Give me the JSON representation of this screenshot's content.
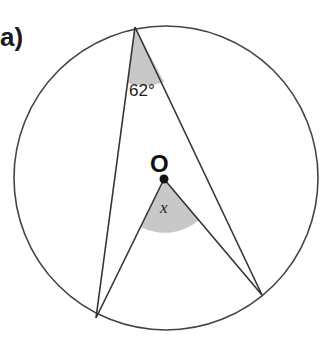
{
  "part_label": "a)",
  "angle_label": "62°",
  "center_label": "O",
  "unknown_label": "x",
  "colors": {
    "stroke": "#444444",
    "shade": "#c8c8c8",
    "text": "#222222"
  }
}
